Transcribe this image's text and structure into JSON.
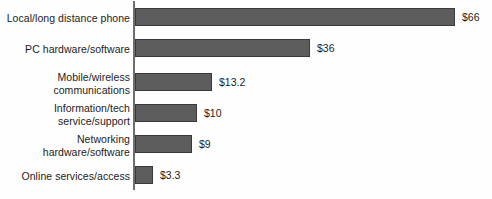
{
  "chart_data": {
    "type": "bar",
    "orientation": "horizontal",
    "title": "",
    "subtitle": "",
    "xlabel": "",
    "ylabel": "",
    "grid": false,
    "legend": null,
    "axis_line": "vertical-left",
    "unit": "$ billions",
    "xlim": [
      0,
      70
    ],
    "categories": [
      "Local/long distance phone",
      "PC hardware/software",
      "Mobile/wireless\ncommunications",
      "Information/tech\nservice/support",
      "Networking\nhardware/software",
      "Online services/access"
    ],
    "values": [
      66,
      36,
      13.2,
      10,
      9,
      3.3
    ],
    "value_labels": [
      "$66",
      "$36",
      "$13.2",
      "$10",
      "$9",
      "$3.3"
    ],
    "colors": {
      "bar_fill": "#5d5d5d",
      "bar_border": "#3a3a3a",
      "axis": "#6e6e6e",
      "text": "#1c1c1c",
      "background": "#ffffff"
    }
  },
  "bars": [
    {
      "label": "Local/long distance phone",
      "value_label": "$66",
      "value": 66,
      "top": 8,
      "width": 320,
      "label_top": 12,
      "value_left": 462
    },
    {
      "label": "PC hardware/software",
      "value_label": "$36",
      "value": 36,
      "top": 39,
      "width": 175,
      "label_top": 43,
      "value_left": 317
    },
    {
      "label": "Mobile/wireless\ncommunications",
      "value_label": "$13.2",
      "value": 13.2,
      "top": 73,
      "width": 77,
      "label_top": 71,
      "value_left": 219
    },
    {
      "label": "Information/tech\nservice/support",
      "value_label": "$10",
      "value": 10,
      "top": 104,
      "width": 62,
      "label_top": 102,
      "value_left": 204
    },
    {
      "label": "Networking\nhardware/software",
      "value_label": "$9",
      "value": 9,
      "top": 135,
      "width": 57,
      "label_top": 133,
      "value_left": 199
    },
    {
      "label": "Online services/access",
      "value_label": "$3.3",
      "value": 3.3,
      "top": 166,
      "width": 18,
      "label_top": 170,
      "value_left": 160
    }
  ]
}
